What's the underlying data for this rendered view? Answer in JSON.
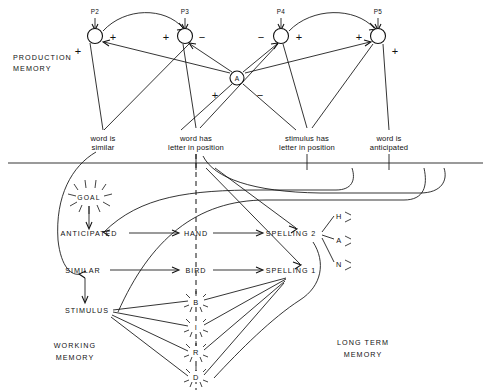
{
  "diagram": {
    "title_regions": {
      "production_memory": "PRODUCTION\nMEMORY",
      "production_memory_l1": "PRODUCTION",
      "production_memory_l2": "MEMORY",
      "working_memory_l1": "WORKING",
      "working_memory_l2": "MEMORY",
      "long_term_memory_l1": "LONG TERM",
      "long_term_memory_l2": "MEMORY"
    },
    "production_nodes": [
      {
        "id": "p2",
        "label": "P2",
        "x": 95,
        "y": 36,
        "signs": [
          {
            "t": "+",
            "x": 113,
            "y": 41
          },
          {
            "t": "+",
            "x": 78,
            "y": 51
          }
        ]
      },
      {
        "id": "p3",
        "label": "P3",
        "x": 185,
        "y": 36,
        "signs": [
          {
            "t": "+",
            "x": 166,
            "y": 41
          },
          {
            "t": "−",
            "x": 201,
            "y": 41
          }
        ]
      },
      {
        "id": "p4",
        "label": "P4",
        "x": 281,
        "y": 36,
        "signs": [
          {
            "t": "−",
            "x": 262,
            "y": 41
          },
          {
            "t": "+",
            "x": 299,
            "y": 41
          }
        ]
      },
      {
        "id": "p5",
        "label": "P5",
        "x": 378,
        "y": 36,
        "signs": [
          {
            "t": "+",
            "x": 359,
            "y": 41
          },
          {
            "t": "+",
            "x": 395,
            "y": 51
          }
        ]
      }
    ],
    "action_node": {
      "id": "a",
      "label": "A",
      "x": 237,
      "y": 78,
      "plus": "+",
      "minus": "−",
      "plus_x": 215,
      "plus_y": 96,
      "minus_x": 259,
      "minus_y": 96
    },
    "conditions": [
      {
        "id": "c1",
        "line1": "word is",
        "line2": "similar",
        "x": 103,
        "y": 140,
        "tick_x": 103
      },
      {
        "id": "c2",
        "line1": "word has",
        "line2": "letter in position",
        "x": 196,
        "y": 140,
        "tick_x": 196
      },
      {
        "id": "c3",
        "line1": "stimulus has",
        "line2": "letter in position",
        "x": 307,
        "y": 140,
        "tick_x": 307
      },
      {
        "id": "c4",
        "line1": "word is",
        "line2": "anticipated",
        "x": 389,
        "y": 140,
        "tick_x": 389
      }
    ],
    "goal": {
      "label": "GOAL",
      "x": 89,
      "y": 197
    },
    "wm_nodes": [
      {
        "id": "anticipated",
        "label": "ANTICIPATED",
        "x": 89,
        "y": 235
      },
      {
        "id": "similar",
        "label": "SIMILAR",
        "x": 83,
        "y": 272
      },
      {
        "id": "stimulus",
        "label": "STIMULUS",
        "x": 87,
        "y": 311
      },
      {
        "id": "hand",
        "label": "HAND",
        "x": 196,
        "y": 235
      },
      {
        "id": "bird",
        "label": "BIRD",
        "x": 196,
        "y": 272
      },
      {
        "id": "spelling2",
        "label": "SPELLING 2",
        "x": 291,
        "y": 235
      },
      {
        "id": "spelling1",
        "label": "SPELLING 1",
        "x": 291,
        "y": 272
      }
    ],
    "stimulus_letters": [
      {
        "id": "letter-b",
        "label": "B",
        "x": 196,
        "y": 302
      },
      {
        "id": "letter-i",
        "label": "I",
        "x": 196,
        "y": 327
      },
      {
        "id": "letter-r",
        "label": "R",
        "x": 196,
        "y": 352
      },
      {
        "id": "letter-d",
        "label": "D",
        "x": 196,
        "y": 377
      }
    ],
    "spelling2_letters": [
      {
        "id": "letter-h",
        "label": "H",
        "x": 341,
        "y": 218
      },
      {
        "id": "letter-a",
        "label": "A",
        "x": 341,
        "y": 241
      },
      {
        "id": "letter-n",
        "label": "N",
        "x": 341,
        "y": 265
      }
    ],
    "divider_y": 163
  }
}
